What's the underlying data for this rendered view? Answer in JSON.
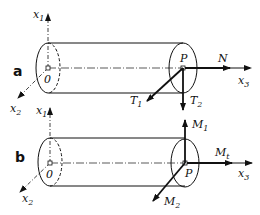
{
  "diagram": {
    "panels": [
      {
        "id": "a",
        "label": "a",
        "origin_label": "0",
        "point_label": "P",
        "axes": {
          "x1": {
            "base": "x",
            "sub": "1"
          },
          "x2": {
            "base": "x",
            "sub": "2"
          },
          "x3": {
            "base": "x",
            "sub": "3"
          }
        },
        "vectors": [
          {
            "name": "N",
            "base": "N",
            "sub": "",
            "direction": "along x3"
          },
          {
            "name": "T1",
            "base": "T",
            "sub": "1",
            "direction": "along x2"
          },
          {
            "name": "T2",
            "base": "T",
            "sub": "2",
            "direction": "along -x1"
          }
        ]
      },
      {
        "id": "b",
        "label": "b",
        "origin_label": "0",
        "point_label": "P",
        "axes": {
          "x1": {
            "base": "x",
            "sub": "1"
          },
          "x2": {
            "base": "x",
            "sub": "2"
          },
          "x3": {
            "base": "x",
            "sub": "3"
          }
        },
        "vectors": [
          {
            "name": "M1",
            "base": "M",
            "sub": "1",
            "direction": "along x1"
          },
          {
            "name": "Mt",
            "base": "M",
            "sub": "t",
            "direction": "along x3"
          },
          {
            "name": "M2",
            "base": "M",
            "sub": "2",
            "direction": "along x2"
          }
        ]
      }
    ]
  }
}
